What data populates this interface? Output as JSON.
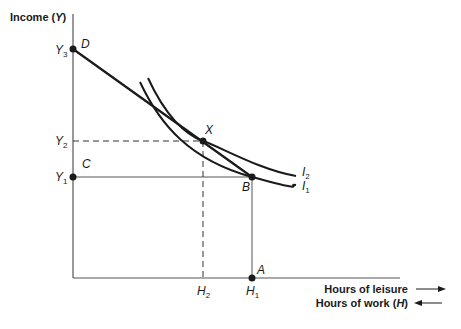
{
  "diagram": {
    "y_axis_title": "Income (Y)",
    "y_axis_title_pre": "Income (",
    "y_axis_title_var": "Y",
    "y_axis_title_post": ")",
    "x_axis_legend": [
      {
        "text": "Hours of leisure",
        "direction": "right"
      },
      {
        "text_pre": "Hours of work (",
        "var": "H",
        "text_post": ")",
        "text": "Hours of work (H)",
        "direction": "left"
      }
    ],
    "points": {
      "D": "D",
      "X": "X",
      "B": "B",
      "C": "C",
      "A": "A"
    },
    "y_ticks": [
      {
        "main": "Y",
        "sub": "3"
      },
      {
        "main": "Y",
        "sub": "2"
      },
      {
        "main": "Y",
        "sub": "1"
      }
    ],
    "x_ticks": [
      {
        "main": "H",
        "sub": "2"
      },
      {
        "main": "H",
        "sub": "1"
      }
    ],
    "curves": [
      {
        "main": "I",
        "sub": "2"
      },
      {
        "main": "I",
        "sub": "1"
      }
    ],
    "colors": {
      "line": "#1a1a1a",
      "axis": "#555555",
      "background": "#ffffff"
    }
  }
}
